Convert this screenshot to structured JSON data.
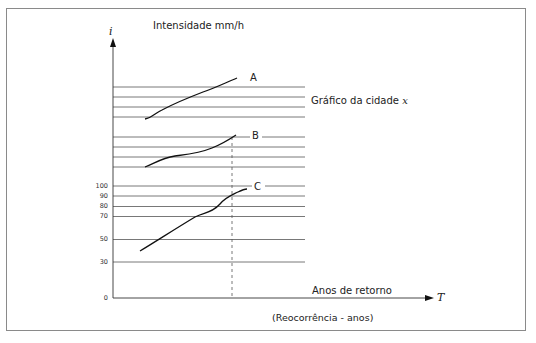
{
  "title": "Intensidade mm/h",
  "y_axis_symbol": "i",
  "x_axis_symbol": "T",
  "x_axis_label": "Anos de retorno",
  "x_axis_sublabel": "(Reocorrência - anos)",
  "city_label": "Gráfico da cidade",
  "city_var": "x",
  "curves": [
    {
      "label": "A"
    },
    {
      "label": "B"
    },
    {
      "label": "C"
    }
  ],
  "y_ticks": [
    "100",
    "90",
    "80",
    "70",
    "50",
    "30",
    "0"
  ],
  "colors": {
    "line": "#1a1a1a",
    "grid": "#555555",
    "frame": "#8a8a8a"
  }
}
